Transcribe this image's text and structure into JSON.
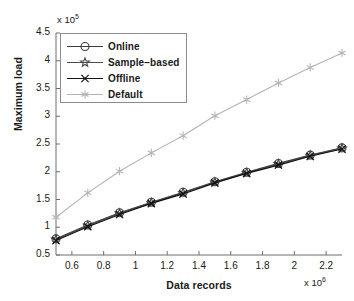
{
  "chart_data": {
    "type": "line",
    "title": "",
    "xlabel": "Data records",
    "ylabel": "Maximum load",
    "x_exponent_label": "x 10",
    "x_exponent_power": "6",
    "y_exponent_label": "x 10",
    "y_exponent_power": "5",
    "xlim": [
      0.5,
      2.3
    ],
    "ylim": [
      0.5,
      4.5
    ],
    "xticks": [
      0.6,
      0.8,
      1,
      1.2,
      1.4,
      1.6,
      1.8,
      2,
      2.2
    ],
    "xtick_labels": [
      "0.6",
      "0.8",
      "1",
      "1.2",
      "1.4",
      "1.6",
      "1.8",
      "2",
      "2.2"
    ],
    "yticks": [
      0.5,
      1,
      1.5,
      2,
      2.5,
      3,
      3.5,
      4,
      4.5
    ],
    "ytick_labels": [
      "0.5",
      "1",
      "1.5",
      "2",
      "2.5",
      "3",
      "3.5",
      "4",
      "4.5"
    ],
    "grid": false,
    "legend_position": "upper-left",
    "x": [
      0.5,
      0.7,
      0.9,
      1.1,
      1.3,
      1.5,
      1.7,
      1.9,
      2.1,
      2.3
    ],
    "series": [
      {
        "name": "Online",
        "marker": "circle",
        "color": "#3c3c3c",
        "values": [
          0.79,
          1.04,
          1.26,
          1.45,
          1.63,
          1.82,
          1.99,
          2.15,
          2.3,
          2.43
        ]
      },
      {
        "name": "Sample−based",
        "marker": "star",
        "color": "#4a4a4a",
        "values": [
          0.78,
          1.03,
          1.25,
          1.44,
          1.62,
          1.81,
          1.98,
          2.14,
          2.29,
          2.42
        ]
      },
      {
        "name": "Offline",
        "marker": "x",
        "color": "#111111",
        "values": [
          0.76,
          1.01,
          1.23,
          1.43,
          1.6,
          1.8,
          1.97,
          2.12,
          2.28,
          2.41
        ]
      },
      {
        "name": "Default",
        "marker": "asterisk",
        "color": "#b4b4b4",
        "values": [
          1.18,
          1.62,
          2.01,
          2.34,
          2.65,
          3.01,
          3.3,
          3.6,
          3.88,
          4.14
        ]
      }
    ]
  },
  "legend": {
    "items": [
      {
        "label": "Online",
        "marker": "circle-marker"
      },
      {
        "label": "Sample−based",
        "marker": "star-marker"
      },
      {
        "label": "Offline",
        "marker": "x-marker"
      },
      {
        "label": "Default",
        "marker": "asterisk-marker"
      }
    ]
  }
}
